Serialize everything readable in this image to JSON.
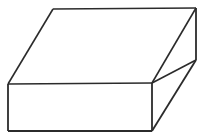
{
  "figure": {
    "kind": "line-drawing",
    "projection": "oblique",
    "title": "",
    "caption": "",
    "background_color": "#ffffff",
    "stroke_color": "#2b2b2b",
    "fill_color": "#ffffff",
    "stroke_width": 1.6,
    "canvas": {
      "width": 204,
      "height": 140
    },
    "vertices": {
      "top_back_left": [
        53,
        9
      ],
      "top_back_right": [
        196,
        8
      ],
      "top_front_right": [
        152,
        83
      ],
      "top_front_left": [
        8,
        84
      ],
      "bottom_front_left": [
        8,
        131
      ],
      "bottom_front_right": [
        152,
        131
      ],
      "bottom_back_right": [
        196,
        60
      ]
    },
    "faces": [
      {
        "name": "top-face",
        "points": "53,9 196,8 152,83 8,84"
      },
      {
        "name": "front-face",
        "points": "8,84 152,83 152,131 8,131"
      },
      {
        "name": "right-face",
        "points": "152,83 196,60 196,8 152,83 152,131 196,60"
      }
    ],
    "right_face_points": "152,83 196,60 196,8 196,60 152,131",
    "right_face_quad": "152,83 196,8 196,60 152,131",
    "edges": [
      {
        "name": "top-back-edge",
        "d": "M 53,9 L 196,8"
      },
      {
        "name": "top-left-edge",
        "d": "M 53,9 L 8,84"
      },
      {
        "name": "top-front-edge",
        "d": "M 8,84 L 152,83"
      },
      {
        "name": "top-right-edge",
        "d": "M 196,8 L 152,83"
      },
      {
        "name": "front-left-vertical-edge",
        "d": "M 8,84 L 8,131"
      },
      {
        "name": "front-bottom-edge",
        "d": "M 8,131 L 152,131"
      },
      {
        "name": "front-right-vertical-edge",
        "d": "M 152,83 L 152,131"
      },
      {
        "name": "back-right-vertical-edge",
        "d": "M 196,8 L 196,60"
      },
      {
        "name": "bottom-right-edge",
        "d": "M 196,60 L 152,131"
      },
      {
        "name": "side-upper-edge",
        "d": "M 152,83 L 196,60"
      }
    ]
  }
}
